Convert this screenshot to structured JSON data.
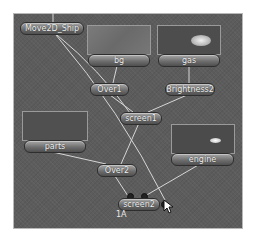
{
  "graph": {
    "nodes": {
      "move2d_ship": {
        "label": "Move2D_Ship"
      },
      "bg": {
        "label": "bg"
      },
      "gas": {
        "label": "gas"
      },
      "over1": {
        "label": "Over1"
      },
      "brightness2": {
        "label": "Brightness2"
      },
      "screen1": {
        "label": "screen1"
      },
      "parts": {
        "label": "parts"
      },
      "engine": {
        "label": "engine"
      },
      "over2": {
        "label": "Over2"
      },
      "screen2": {
        "label": "screen2"
      }
    },
    "caption": "1A"
  },
  "colors": {
    "canvas": "#5c5c5c",
    "wire": "#d8d8d8",
    "node_fill": "#7a7a7a",
    "node_text": "#f2f2f2"
  }
}
